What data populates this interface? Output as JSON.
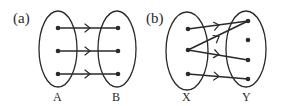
{
  "diagram": {
    "panels": [
      {
        "id": "a",
        "label": "(a)",
        "domain_set": {
          "name": "A",
          "points": 3
        },
        "codomain_set": {
          "name": "B",
          "points": 3
        },
        "mappings": [
          {
            "from": 1,
            "to": 1
          },
          {
            "from": 2,
            "to": 2
          },
          {
            "from": 3,
            "to": 3
          }
        ],
        "description": "one-to-one correspondence"
      },
      {
        "id": "b",
        "label": "(b)",
        "domain_set": {
          "name": "X",
          "points": 3
        },
        "codomain_set": {
          "name": "Y",
          "points": 4
        },
        "mappings": [
          {
            "from": 1,
            "to": 1
          },
          {
            "from": 2,
            "to": 1
          },
          {
            "from": 2,
            "to": 3
          },
          {
            "from": 3,
            "to": 4
          }
        ],
        "unmapped_codomain_points": [
          2
        ],
        "description": "relation that is not a function"
      }
    ]
  },
  "labels": {
    "panel_a": "(a)",
    "panel_b": "(b)",
    "set_A": "A",
    "set_B": "B",
    "set_X": "X",
    "set_Y": "Y"
  }
}
